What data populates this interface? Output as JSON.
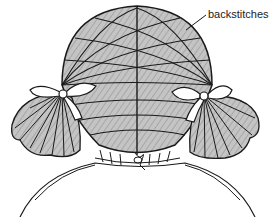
{
  "figure": {
    "callout_label": "backstitches",
    "colors": {
      "hair_fill": "#bdbdbd",
      "line": "#1a1a1a",
      "background": "#ffffff",
      "bow_fill": "#ffffff"
    }
  }
}
